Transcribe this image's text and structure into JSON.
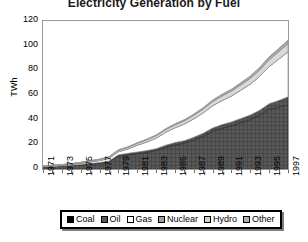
{
  "chart_data": {
    "type": "area",
    "title": "Electricity Generation by Fuel",
    "xlabel": "",
    "ylabel": "TWh",
    "ylim": [
      0,
      120
    ],
    "ytick_step": 20,
    "yticks": [
      "0",
      "20",
      "40",
      "60",
      "80",
      "100",
      "120"
    ],
    "grid": false,
    "legend_position": "bottom",
    "x": [
      1971,
      1972,
      1973,
      1974,
      1975,
      1976,
      1977,
      1978,
      1979,
      1980,
      1981,
      1982,
      1983,
      1984,
      1985,
      1986,
      1987,
      1988,
      1989,
      1990,
      1991,
      1992,
      1993,
      1994,
      1995,
      1996,
      1997
    ],
    "xticks": [
      "1971",
      "1973",
      "1975",
      "1977",
      "1979",
      "1981",
      "1983",
      "1985",
      "1987",
      "1989",
      "1991",
      "1993",
      "1995",
      "1997"
    ],
    "series": [
      {
        "name": "Coal",
        "color": "#3d3d3d",
        "values": [
          1.5,
          1.8,
          2.2,
          2.6,
          3.2,
          3.8,
          4.6,
          5.6,
          10.5,
          11.5,
          12.5,
          13.5,
          15.0,
          17.5,
          19.5,
          21.0,
          23.5,
          26.5,
          30.5,
          33.0,
          35.0,
          37.5,
          40.0,
          43.5,
          48.5,
          50.0,
          52.0
        ]
      },
      {
        "name": "Oil",
        "color": "#4a4a4a",
        "values": [
          0.3,
          0.3,
          0.4,
          0.4,
          0.5,
          0.6,
          0.7,
          0.8,
          1.0,
          1.2,
          1.3,
          1.4,
          1.5,
          1.7,
          1.9,
          2.0,
          2.2,
          2.5,
          2.8,
          3.0,
          3.2,
          3.5,
          3.8,
          4.2,
          4.5,
          5.5,
          6.5
        ]
      },
      {
        "name": "Gas",
        "color": "#ffffff",
        "values": [
          0.2,
          0.3,
          0.4,
          0.6,
          0.8,
          1.2,
          1.6,
          2.2,
          2.5,
          3.5,
          5.5,
          7.0,
          8.5,
          10.5,
          12.0,
          13.5,
          15.0,
          16.5,
          18.0,
          19.5,
          21.0,
          23.0,
          25.0,
          27.5,
          30.0,
          33.5,
          36.5
        ]
      },
      {
        "name": "Nuclear",
        "color": "#bdbdbd",
        "values": [
          0.0,
          0.0,
          0.0,
          0.0,
          0.0,
          0.0,
          0.0,
          0.0,
          0.0,
          0.0,
          0.0,
          0.0,
          0.0,
          0.0,
          0.0,
          0.0,
          0.0,
          0.0,
          0.0,
          0.0,
          0.0,
          0.0,
          0.0,
          0.0,
          0.0,
          0.0,
          0.0
        ]
      },
      {
        "name": "Hydro",
        "color": "#d9d9d9",
        "values": [
          0.4,
          0.5,
          0.5,
          0.6,
          0.7,
          0.8,
          0.9,
          1.0,
          1.2,
          1.3,
          1.5,
          1.7,
          1.9,
          2.1,
          2.3,
          2.5,
          2.7,
          3.0,
          3.3,
          3.6,
          3.9,
          4.2,
          4.6,
          5.0,
          5.5,
          6.0,
          6.5
        ]
      },
      {
        "name": "Other",
        "color": "#a8a8a8",
        "values": [
          0.1,
          0.1,
          0.1,
          0.1,
          0.2,
          0.2,
          0.2,
          0.3,
          0.3,
          0.4,
          0.4,
          0.5,
          0.6,
          0.7,
          0.8,
          0.9,
          1.0,
          1.1,
          1.2,
          1.4,
          1.5,
          1.7,
          1.9,
          2.1,
          2.3,
          2.5,
          2.8
        ]
      }
    ],
    "total_values": [
      2.5,
      3.0,
      3.6,
      4.3,
      5.4,
      6.6,
      8.0,
      9.9,
      15.5,
      17.9,
      21.2,
      24.1,
      27.5,
      32.5,
      36.5,
      39.9,
      44.4,
      49.6,
      55.8,
      60.5,
      64.6,
      69.9,
      75.3,
      82.3,
      90.8,
      97.5,
      104.3
    ],
    "annotations": []
  },
  "legend": {
    "items": [
      {
        "label": "Coal",
        "color": "#000000"
      },
      {
        "label": "Oil",
        "color": "#585858"
      },
      {
        "label": "Gas",
        "color": "#ffffff"
      },
      {
        "label": "Nuclear",
        "color": "#9e9e9e"
      },
      {
        "label": "Hydro",
        "color": "#cfcfcf"
      },
      {
        "label": "Other",
        "color": "#b0b0b0"
      }
    ]
  }
}
